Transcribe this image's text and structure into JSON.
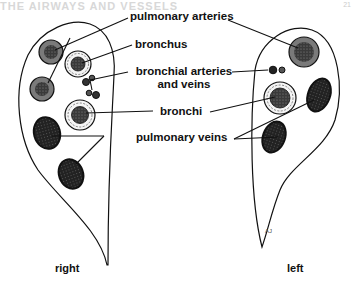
{
  "header": {
    "ghost_text": "THE AIRWAYS AND VESSELS",
    "page_number": "21"
  },
  "labels": {
    "pulmonary_arteries": "pulmonary arteries",
    "bronchus": "bronchus",
    "bronchial_vessels_line1": "bronchial arteries",
    "bronchial_vessels_line2": "and veins",
    "bronchi": "bronchi",
    "pulmonary_veins": "pulmonary veins"
  },
  "sides": {
    "right": "right",
    "left": "left"
  },
  "artist_initials": "AJ",
  "colors": {
    "outline": "#111111",
    "artery_ring": "#7a7a7a",
    "artery_core": "#3a3a3a",
    "vein_fill": "#2b2b2b",
    "bronchus_ring": "#f4f4f4"
  }
}
